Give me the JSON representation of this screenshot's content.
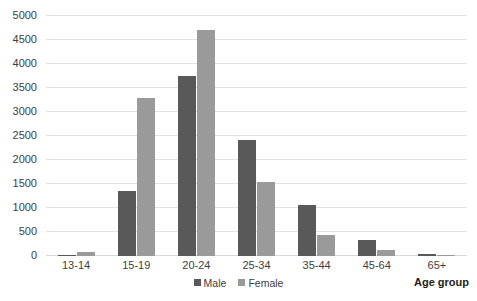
{
  "chart_data": {
    "type": "bar",
    "title": "",
    "xlabel": "Age group",
    "ylabel": "",
    "categories": [
      "13-14",
      "15-19",
      "20-24",
      "25-34",
      "35-44",
      "45-64",
      "65+"
    ],
    "series": [
      {
        "name": "Male",
        "color": "#595959",
        "values": [
          10,
          1350,
          3750,
          2420,
          1060,
          330,
          40
        ]
      },
      {
        "name": "Female",
        "color": "#9a9a9a",
        "values": [
          90,
          3300,
          4700,
          1550,
          430,
          120,
          5
        ]
      }
    ],
    "ylim": [
      0,
      5000
    ],
    "y_ticks": [
      0,
      500,
      1000,
      1500,
      2000,
      2500,
      3000,
      3500,
      4000,
      4500,
      5000
    ],
    "y_tick_labels": [
      "0",
      "500",
      "1000",
      "1500",
      "2000",
      "2500",
      "3000",
      "3500",
      "4000",
      "4500",
      "5000"
    ],
    "grid": true,
    "legend_position": "bottom",
    "legend_entries": [
      "Male",
      "Female"
    ]
  },
  "colors": {
    "male": "#595959",
    "female": "#9a9a9a",
    "gridline": "#e2e2e2",
    "text": "#404040",
    "axis_title": "#1d1d1d",
    "background": "#ffffff"
  }
}
